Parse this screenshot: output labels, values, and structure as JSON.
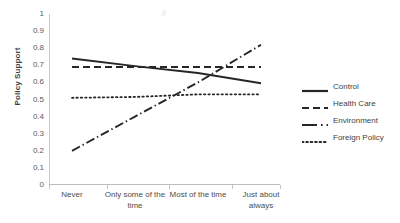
{
  "chart_data": {
    "type": "line",
    "title": "",
    "xlabel": "",
    "ylabel": "Policy Support",
    "ylim": [
      0,
      1
    ],
    "ytick_labels": [
      "1",
      "0.9",
      "0.8",
      "0.7",
      "0.6",
      "0.5",
      "0.4",
      "0.3",
      "0.2",
      "0.1",
      "0"
    ],
    "ytick_values": [
      1,
      0.9,
      0.8,
      0.7,
      0.6,
      0.5,
      0.4,
      0.3,
      0.2,
      0.1,
      0
    ],
    "grid": false,
    "legend_position": "right",
    "categories": [
      "Never",
      "Only some of the time",
      "Most of the time",
      "Just about always"
    ],
    "series": [
      {
        "name": "Control",
        "style": "solid",
        "values": [
          0.74,
          0.695,
          0.655,
          0.595
        ]
      },
      {
        "name": "Health Care",
        "style": "dashed",
        "values": [
          0.69,
          0.69,
          0.69,
          0.69
        ]
      },
      {
        "name": "Environment",
        "style": "dash-dot",
        "values": [
          0.2,
          0.4,
          0.6,
          0.82
        ]
      },
      {
        "name": "Foreign Policy",
        "style": "dotted",
        "values": [
          0.51,
          0.515,
          0.53,
          0.53
        ]
      }
    ]
  },
  "axis": {
    "y_title": "Policy Support"
  },
  "legend": {
    "items": [
      {
        "label": "Control"
      },
      {
        "label": "Health Care"
      },
      {
        "label": "Environment"
      },
      {
        "label": "Foreign Policy"
      }
    ]
  },
  "colors": {
    "line": "#262626",
    "axis": "#c2c2c2",
    "text": "#404040"
  }
}
